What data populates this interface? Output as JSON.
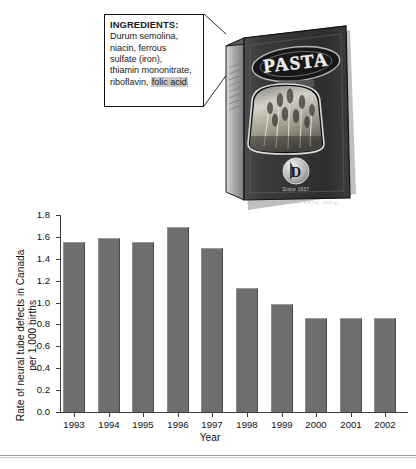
{
  "callout": {
    "title": "INGREDIENTS:",
    "lines": [
      "Durum semolina,",
      "niacin, ferrous",
      "sulfate (iron),",
      "thiamin mononitrate,"
    ],
    "last_line_prefix": "riboflavin, ",
    "highlighted_term": "folic acid"
  },
  "package": {
    "brand": "PASTA",
    "emblem_letter": "D",
    "since_text": "Since 1937",
    "net_weight": "NET WEIGHT 8.8 OZ. (250 g)",
    "window_label": "wheat-stalks-photo"
  },
  "chart_data": {
    "type": "bar",
    "title": "",
    "categories": [
      "1993",
      "1994",
      "1995",
      "1996",
      "1997",
      "1998",
      "1999",
      "2000",
      "2001",
      "2002"
    ],
    "values": [
      1.55,
      1.59,
      1.55,
      1.69,
      1.5,
      1.13,
      0.99,
      0.86,
      0.86,
      0.86
    ],
    "xlabel": "Year",
    "ylabel": "Rate of neural tube defects in Canada per 1,000 births",
    "ylim": [
      0.0,
      1.8
    ],
    "ytick_labels": [
      "0.0",
      "0.2",
      "0.4",
      "0.6",
      "0.8",
      "1.0",
      "1.2",
      "1.4",
      "1.6",
      "1.8"
    ],
    "ytick_values": [
      0.0,
      0.2,
      0.4,
      0.6,
      0.8,
      1.0,
      1.2,
      1.4,
      1.6,
      1.8
    ],
    "grid": false,
    "legend": "none",
    "bar_color": "#6e6e6e"
  },
  "colors": {
    "bar": "#6e6e6e",
    "axis": "#3d3d3d",
    "highlight": "#c9c9c9",
    "rule": "#9a9a9a"
  }
}
